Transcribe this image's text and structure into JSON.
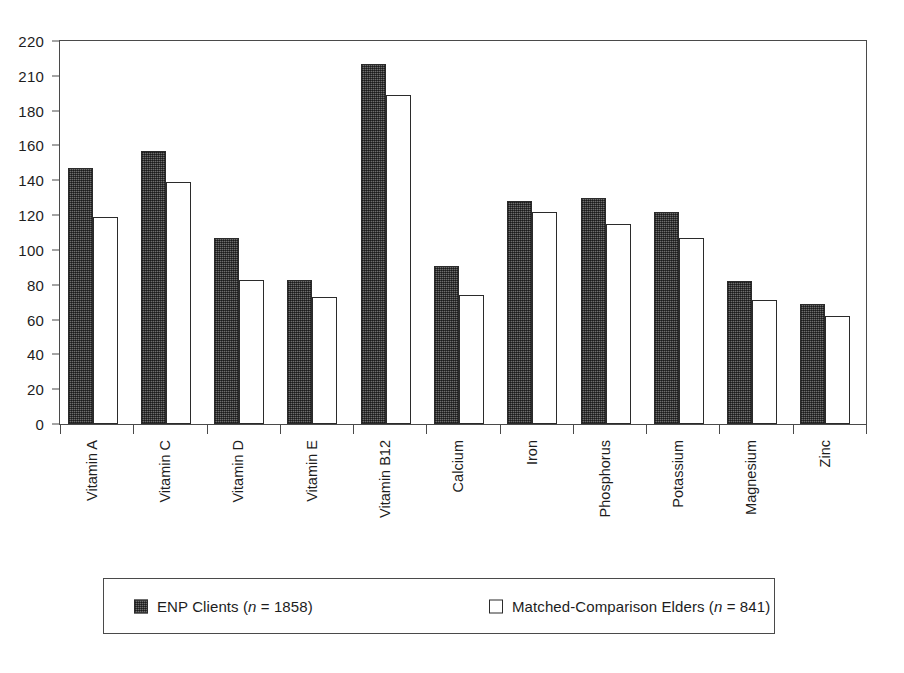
{
  "chart_data": {
    "type": "bar",
    "title": "",
    "subtitle": "",
    "xlabel": "",
    "ylabel": "",
    "ylim": [
      0,
      220
    ],
    "grid": false,
    "legend_position": "bottom",
    "y_ticks": [
      0,
      20,
      40,
      60,
      80,
      100,
      120,
      140,
      160,
      180,
      210,
      220
    ],
    "y_tick_labels": [
      "0",
      "20",
      "40",
      "60",
      "80",
      "100",
      "120",
      "140",
      "160",
      "180",
      "210",
      "220"
    ],
    "categories": [
      "Vitamin A",
      "Vitamin C",
      "Vitamin D",
      "Vitamin E",
      "Vitamin B12",
      "Calcium",
      "Iron",
      "Phosphorus",
      "Potassium",
      "Magnesium",
      "Zinc"
    ],
    "series": [
      {
        "name": "ENP Clients",
        "n": 1858,
        "color": "#6d6d6d",
        "values": [
          147,
          157,
          107,
          83,
          207,
          91,
          128,
          130,
          122,
          82,
          69
        ]
      },
      {
        "name": "Matched-Comparison Elders",
        "n": 841,
        "color": "#ffffff",
        "values": [
          119,
          139,
          83,
          73,
          189,
          74,
          122,
          115,
          107,
          71,
          62
        ]
      }
    ]
  },
  "legend": {
    "entries": [
      {
        "swatch": "dark",
        "text_before": "ENP Clients (",
        "italic": "n",
        "text_after": " = 1858)",
        "full": "ENP Clients (n = 1858)"
      },
      {
        "swatch": "light",
        "text_before": "Matched-Comparison Elders (",
        "italic": "n",
        "text_after": " = 841)",
        "full": "Matched-Comparison Elders (n = 841)"
      }
    ]
  },
  "colors": {
    "axis": "#4a4a4a",
    "text": "#1d1d1d",
    "bar_dark": "#6d6d6d",
    "bar_light": "#ffffff",
    "bar_outline": "#2b2b2b",
    "background": "#ffffff"
  }
}
